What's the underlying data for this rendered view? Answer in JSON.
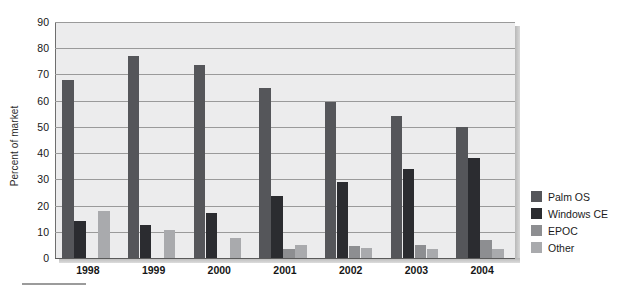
{
  "chart_data": {
    "type": "bar",
    "title": "",
    "subtitle": "",
    "xlabel": "",
    "ylabel": "Percent of market",
    "ylim": [
      0,
      90
    ],
    "ytick_step": 10,
    "yticks": [
      90,
      80,
      70,
      60,
      50,
      40,
      30,
      20,
      10,
      0
    ],
    "grid": true,
    "grid_axis": "y",
    "legend_position": "right",
    "categories": [
      "1998",
      "1999",
      "2000",
      "2001",
      "2002",
      "2003",
      "2004"
    ],
    "series": [
      {
        "name": "Palm OS",
        "color": "#55565a",
        "values": [
          68,
          77,
          73.5,
          65,
          59.5,
          54,
          50
        ]
      },
      {
        "name": "Windows CE",
        "color": "#2b2c30",
        "values": [
          14,
          12.5,
          17,
          23.5,
          29,
          34,
          38
        ]
      },
      {
        "name": "EPOC",
        "color": "#8d8e91",
        "values": [
          0,
          0,
          0,
          3.5,
          4.5,
          5,
          7
        ]
      },
      {
        "name": "Other",
        "color": "#a9aaad",
        "values": [
          18,
          10.5,
          7.5,
          5,
          4,
          3.5,
          3.5
        ]
      }
    ]
  },
  "legend": {
    "entries": [
      {
        "label": "Palm OS",
        "color": "#55565a"
      },
      {
        "label": "Windows CE",
        "color": "#2b2c30"
      },
      {
        "label": "EPOC",
        "color": "#8d8e91"
      },
      {
        "label": "Other",
        "color": "#a9aaad"
      }
    ]
  },
  "colors": {
    "panel_background": "#ececed",
    "gridline": "#9a9a9a",
    "axis": "#5a5a5a",
    "text": "#161616"
  }
}
